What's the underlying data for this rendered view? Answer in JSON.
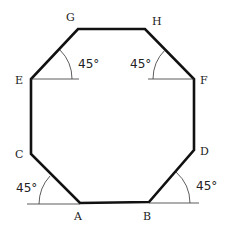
{
  "figure": {
    "type": "octagon-diagram",
    "vertices": [
      {
        "label": "G",
        "x": 78,
        "y": 29,
        "lx": 66,
        "ly": 21
      },
      {
        "label": "H",
        "x": 145,
        "y": 29,
        "lx": 152,
        "ly": 25
      },
      {
        "label": "F",
        "x": 194,
        "y": 79,
        "lx": 200,
        "ly": 84
      },
      {
        "label": "D",
        "x": 194,
        "y": 150,
        "lx": 200,
        "ly": 155
      },
      {
        "label": "B",
        "x": 149,
        "y": 202,
        "lx": 143,
        "ly": 220
      },
      {
        "label": "A",
        "x": 80,
        "y": 203,
        "lx": 74,
        "ly": 220
      },
      {
        "label": "C",
        "x": 31,
        "y": 154,
        "lx": 15,
        "ly": 158
      },
      {
        "label": "E",
        "x": 31,
        "y": 79,
        "lx": 15,
        "ly": 84
      }
    ],
    "angles": [
      {
        "text": "45°",
        "x": 78,
        "y": 68
      },
      {
        "text": "45°",
        "x": 130,
        "y": 68
      },
      {
        "text": "45°",
        "x": 16,
        "y": 192
      },
      {
        "text": "45°",
        "x": 196,
        "y": 190
      }
    ],
    "stroke_color": "#111111"
  }
}
